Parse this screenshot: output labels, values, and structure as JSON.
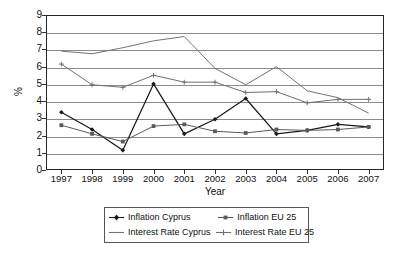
{
  "chart_data": {
    "type": "line",
    "title": "",
    "xlabel": "Year",
    "ylabel": "%",
    "categories": [
      "1997",
      "1998",
      "1999",
      "2000",
      "2001",
      "2002",
      "2003",
      "2004",
      "2005",
      "2006",
      "2007"
    ],
    "x": [
      1997,
      1998,
      1999,
      2000,
      2001,
      2002,
      2003,
      2004,
      2005,
      2006,
      2007
    ],
    "ylim": [
      0,
      9
    ],
    "yticks": [
      0,
      1,
      2,
      3,
      4,
      5,
      6,
      7,
      8,
      9
    ],
    "grid": "horizontal",
    "legend_position": "bottom",
    "series": [
      {
        "name": "Inflation Cyprus",
        "color": "#1a1a1a",
        "marker": "diamond",
        "values": [
          3.35,
          2.35,
          1.15,
          5.0,
          2.1,
          2.95,
          4.15,
          2.1,
          2.3,
          2.65,
          2.5
        ]
      },
      {
        "name": "Inflation EU 25",
        "color": "#5a5a5a",
        "marker": "square",
        "values": [
          2.6,
          2.1,
          1.65,
          2.55,
          2.65,
          2.25,
          2.15,
          2.35,
          2.3,
          2.35,
          2.5
        ]
      },
      {
        "name": "Interest Rate Cyprus",
        "color": "#737373",
        "marker": "none",
        "values": [
          6.9,
          6.75,
          7.1,
          7.5,
          7.75,
          5.9,
          4.95,
          6.0,
          4.6,
          4.2,
          3.3
        ]
      },
      {
        "name": "Interest Rate EU 25",
        "color": "#707070",
        "marker": "plus",
        "values": [
          6.15,
          4.95,
          4.8,
          5.5,
          5.1,
          5.1,
          4.5,
          4.55,
          3.9,
          4.1,
          4.1
        ]
      }
    ]
  },
  "axes": {
    "y_tick_labels": [
      "9",
      "8",
      "7",
      "6",
      "5",
      "4",
      "3",
      "2",
      "1",
      "0"
    ],
    "x_tick_labels": [
      "1997",
      "1998",
      "1999",
      "2000",
      "2001",
      "2002",
      "2003",
      "2004",
      "2005",
      "2006",
      "2007"
    ],
    "x_axis_title": "Year",
    "y_axis_title": "%"
  },
  "legend": {
    "entries": [
      {
        "label": "Inflation Cyprus"
      },
      {
        "label": "Inflation EU 25"
      },
      {
        "label": "Interest Rate Cyprus"
      },
      {
        "label": "Interest Rate EU 25"
      }
    ]
  }
}
